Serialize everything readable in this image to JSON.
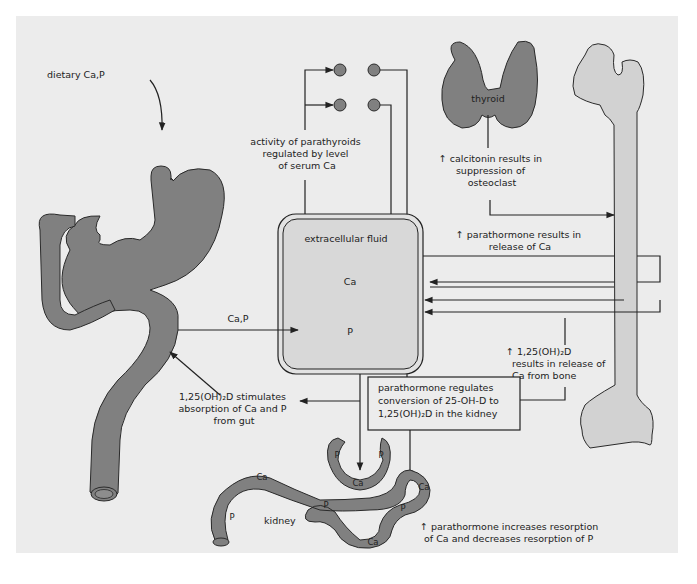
{
  "figure": {
    "labels": {
      "dietary": "dietary Ca,P",
      "parathyroid_activity": [
        "activity of parathyroids",
        "regulated by level",
        "of serum Ca"
      ],
      "thyroid": "thyroid",
      "calcitonin": [
        "↑ calcitonin results in",
        "suppression of",
        "osteoclast"
      ],
      "parathormone_release": [
        "↑ parathormone results in",
        "release of Ca"
      ],
      "extracellular_fluid": "extracellular fluid",
      "ecf_ca": "Ca",
      "ecf_p": "P",
      "gut_transfer": "Ca,P",
      "vitd_bone": [
        "↑ 1,25(OH)₂D",
        "results in release of",
        "Ca from bone"
      ],
      "vitd_gut": [
        "1,25(OH)₂D stimulates",
        "absorption of Ca and P",
        "from gut"
      ],
      "pth_box": [
        "parathormone regulates",
        "conversion of 25-OH-D to",
        "1,25(OH)₂D in the kidney"
      ],
      "kidney": "kidney",
      "kidney_resorption": [
        "↑ parathormone increases resorption",
        "of Ca and decreases resorption of P"
      ],
      "tubule_markers": [
        "Ca",
        "P",
        "P",
        "P",
        "Ca",
        "Ca",
        "P",
        "P",
        "Ca"
      ]
    },
    "organs": [
      "stomach-intestine",
      "parathyroid-glands",
      "thyroid",
      "femur-bone",
      "extracellular-fluid-compartment",
      "kidney-tubule"
    ],
    "colors": {
      "panel": "#ececec",
      "organ": "#808080",
      "bone": "#d2d2d2",
      "line": "#222222"
    }
  }
}
